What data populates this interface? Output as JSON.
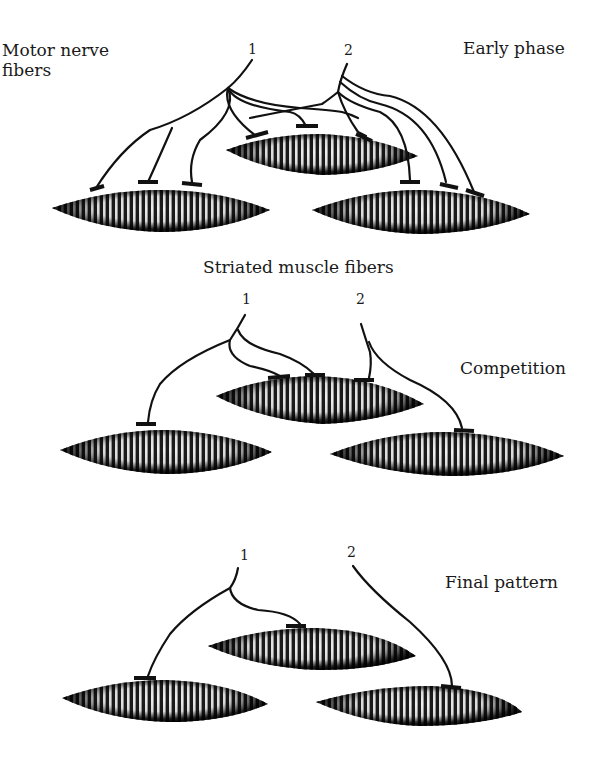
{
  "labels": {
    "motor_nerve_line1": "Motor nerve",
    "motor_nerve_line2": "fibers",
    "striated_muscle": "Striated muscle fibers"
  },
  "panels": [
    {
      "title": "Early phase",
      "neuron_labels": [
        "1",
        "2"
      ],
      "muscle_fibers": [
        {
          "id": "left",
          "cx": 160,
          "cy": 212,
          "rx": 108,
          "ry": 20
        },
        {
          "id": "middle",
          "cx": 322,
          "cy": 155,
          "rx": 96,
          "ry": 18
        },
        {
          "id": "right",
          "cx": 420,
          "cy": 212,
          "rx": 108,
          "ry": 20
        }
      ],
      "innervation": {
        "neuron_1_terminals": 6,
        "neuron_2_terminals": 5
      }
    },
    {
      "title": "Competition",
      "neuron_labels": [
        "1",
        "2"
      ],
      "muscle_fibers": [
        {
          "id": "left",
          "cx": 166,
          "cy": 452,
          "rx": 106,
          "ry": 20
        },
        {
          "id": "middle",
          "cx": 318,
          "cy": 397,
          "rx": 104,
          "ry": 20
        },
        {
          "id": "right",
          "cx": 450,
          "cy": 454,
          "rx": 118,
          "ry": 20
        }
      ],
      "innervation": {
        "neuron_1_terminals": 3,
        "neuron_2_terminals": 2
      }
    },
    {
      "title": "Final pattern",
      "neuron_labels": [
        "1",
        "2"
      ],
      "muscle_fibers": [
        {
          "id": "left",
          "cx": 166,
          "cy": 700,
          "rx": 106,
          "ry": 20
        },
        {
          "id": "middle",
          "cx": 316,
          "cy": 650,
          "rx": 104,
          "ry": 19
        },
        {
          "id": "right",
          "cx": 440,
          "cy": 706,
          "rx": 108,
          "ry": 19
        }
      ],
      "innervation": {
        "neuron_1_terminals": 2,
        "neuron_2_terminals": 1
      }
    }
  ],
  "colors": {
    "ink": "#111111",
    "background": "#ffffff"
  }
}
